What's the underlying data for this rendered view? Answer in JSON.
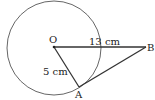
{
  "diagram": {
    "points": {
      "O": {
        "label": "O"
      },
      "A": {
        "label": "A"
      },
      "B": {
        "label": "B"
      }
    },
    "segments": {
      "OB": {
        "label": "13 cm"
      },
      "OA": {
        "label": "5 cm"
      }
    },
    "colors": {
      "stroke": "#333333",
      "circle": "#555555"
    }
  }
}
